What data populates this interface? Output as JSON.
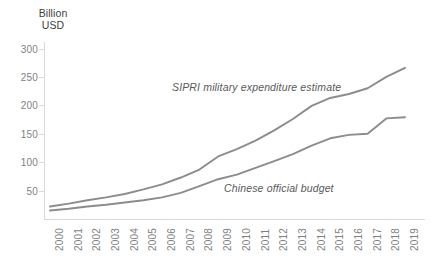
{
  "chart_data": {
    "type": "line",
    "title": "",
    "xlabel": "",
    "ylabel": "Billion\nUSD",
    "ylim": [
      0,
      300
    ],
    "yticks": [
      50,
      100,
      150,
      200,
      250,
      300
    ],
    "grid": false,
    "legend_position": "inline-annotation",
    "categories": [
      "2000",
      "2001",
      "2002",
      "2003",
      "2004",
      "2005",
      "2006",
      "2007",
      "2008",
      "2009",
      "2010",
      "2011",
      "2012",
      "2013",
      "2014",
      "2015",
      "2016",
      "2017",
      "2018",
      "2019"
    ],
    "series": [
      {
        "name": "SIPRI military expenditure estimate",
        "color": "#8c8c8c",
        "values": [
          22,
          27,
          33,
          38,
          44,
          52,
          61,
          73,
          87,
          110,
          123,
          138,
          156,
          176,
          199,
          213,
          220,
          230,
          250,
          266
        ]
      },
      {
        "name": "Chinese official budget",
        "color": "#8c8c8c",
        "values": [
          15,
          18,
          22,
          25,
          29,
          33,
          38,
          46,
          58,
          70,
          78,
          90,
          102,
          114,
          129,
          142,
          148,
          150,
          177,
          179
        ]
      }
    ],
    "annotations": [
      {
        "text": "SIPRI military expenditure estimate",
        "style": "italic"
      },
      {
        "text": "Chinese official budget",
        "style": "italic"
      }
    ]
  },
  "axis": {
    "y_title": "Billion\nUSD",
    "y_tick_labels": [
      "300",
      "250",
      "200",
      "150",
      "100",
      "50"
    ],
    "x_tick_labels": [
      "2000",
      "2001",
      "2002",
      "2003",
      "2004",
      "2005",
      "2006",
      "2007",
      "2008",
      "2009",
      "2010",
      "2011",
      "2012",
      "2013",
      "2014",
      "2015",
      "2016",
      "2017",
      "2018",
      "2019"
    ]
  },
  "labels": {
    "sipri": "SIPRI military expenditure estimate",
    "official": "Chinese official budget"
  },
  "colors": {
    "line": "#8c8c8c",
    "axis": "#d9d9d9",
    "tick_text": "#7f7f7f",
    "title_text": "#404040"
  }
}
